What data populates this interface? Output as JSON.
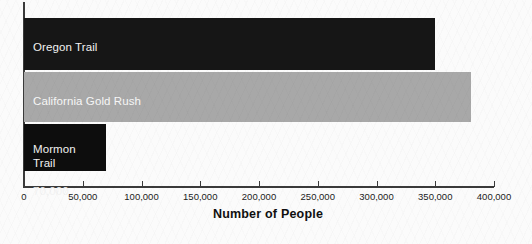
{
  "chart_data": {
    "type": "bar",
    "orientation": "horizontal",
    "title": "",
    "xlabel": "Number of People",
    "ylabel": "",
    "xlim": [
      0,
      400000
    ],
    "grid": false,
    "legend": false,
    "categories": [
      "Oregon Trail",
      "California Gold Rush",
      "Mormon Trail"
    ],
    "values": [
      350000,
      380000,
      70000
    ],
    "value_labels": [
      "about 350,000 people",
      "380,000",
      "70,000"
    ],
    "bar_colors": [
      "#161616",
      "#a8a8a8",
      "#0d0d0d"
    ],
    "tick_values": [
      0,
      50000,
      100000,
      150000,
      200000,
      250000,
      300000,
      350000,
      400000
    ],
    "tick_labels": [
      "0",
      "50,000",
      "100,000",
      "150,000",
      "200,000",
      "250,000",
      "300,000",
      "350,000",
      "400,000"
    ]
  },
  "bars": [
    {
      "name": "Oregon Trail",
      "value_label": "about 350,000 people"
    },
    {
      "name": "California Gold Rush",
      "value_label": "380,000"
    },
    {
      "name": "Mormon\nTrail",
      "value_label": "70,000"
    }
  ],
  "axis": {
    "x_title": "Number of People"
  },
  "colors": {
    "background": "#fbfbfb",
    "axis": "#3a3a3a",
    "bar_dark": "#161616",
    "bar_gray": "#a8a8a8",
    "bar_black": "#0d0d0d",
    "label_light": "#f2f2f2",
    "tick_text": "#1b1b1b"
  }
}
